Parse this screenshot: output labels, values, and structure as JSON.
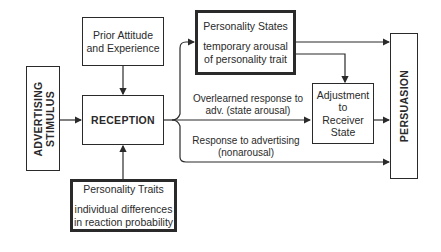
{
  "diagram": {
    "nodes": {
      "advertising_stimulus": {
        "line1": "ADVERTISING",
        "line2": "STIMULUS"
      },
      "prior_attitude": {
        "line1": "Prior Attitude",
        "line2": "and Experience"
      },
      "reception": {
        "label": "RECEPTION"
      },
      "personality_states": {
        "title": "Personality States",
        "line1": "temporary arousal",
        "line2": "of personality trait"
      },
      "personality_traits": {
        "title": "Personality Traits",
        "line1": "individual differences",
        "line2": "in reaction probability"
      },
      "adjustment": {
        "line1": "Adjustment",
        "line2": "to",
        "line3": "Receiver",
        "line4": "State"
      },
      "persuasion": {
        "label": "PERSUASION"
      }
    },
    "edge_labels": {
      "overlearned": {
        "line1": "Overlearned response to",
        "line2": "adv. (state arousal)"
      },
      "nonarousal": {
        "line1": "Response to advertising",
        "line2": "(nonarousal)"
      }
    },
    "edges": [
      {
        "from": "advertising_stimulus",
        "to": "reception"
      },
      {
        "from": "prior_attitude",
        "to": "reception"
      },
      {
        "from": "personality_traits",
        "to": "reception"
      },
      {
        "from": "reception",
        "to": "personality_states"
      },
      {
        "from": "reception",
        "to": "adjustment",
        "label": "Overlearned response to adv. (state arousal)"
      },
      {
        "from": "reception",
        "to": "persuasion",
        "label": "Response to advertising (nonarousal)"
      },
      {
        "from": "personality_states",
        "to": "persuasion"
      },
      {
        "from": "personality_states",
        "to": "adjustment"
      },
      {
        "from": "adjustment",
        "to": "persuasion"
      }
    ]
  }
}
